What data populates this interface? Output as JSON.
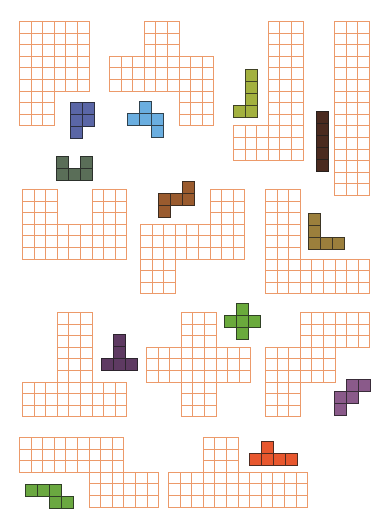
{
  "puzzle": {
    "grid_line_color": "#ec9a6a",
    "board_cell_size": 11.6,
    "piece_cell_size": 12,
    "boards": [
      {
        "id": "board-1",
        "x": 19,
        "y": 21,
        "rows": [
          "XXXXXX",
          "XXXXXX",
          "XXXXXX",
          "XXXXXX",
          "XXXXXX",
          "XXXXXX",
          "XXX...",
          "XXX...",
          "XXX..."
        ]
      },
      {
        "id": "board-2",
        "x": 109,
        "y": 21,
        "rows": [
          "...XXX...",
          "...XXX...",
          "...XXX...",
          "XXXXXXXXX",
          "XXXXXXXXX",
          "XXXXXXXXX",
          "......XXX",
          "......XXX",
          "......XXX"
        ]
      },
      {
        "id": "board-3",
        "x": 233,
        "y": 21,
        "rows": [
          "...XXX",
          "...XXX",
          "...XXX",
          "...XXX",
          "...XXX",
          "...XXX",
          "...XXX",
          "...XXX",
          "...XXX",
          "XXXXXX",
          "XXXXXX",
          "XXXXXX"
        ]
      },
      {
        "id": "board-4",
        "x": 334,
        "y": 21,
        "rows": [
          "XXX",
          "XXX",
          "XXX",
          "XXX",
          "XXX",
          "XXX",
          "XXX",
          "XXX",
          "XXX",
          "XXX",
          "XXX",
          "XXX",
          "XXX",
          "XXX",
          "XXX"
        ]
      },
      {
        "id": "board-5",
        "x": 22,
        "y": 189,
        "rows": [
          "XXX...XXX",
          "XXX...XXX",
          "XXX...XXX",
          "XXXXXXXXX",
          "XXXXXXXXX",
          "XXXXXXXXX"
        ]
      },
      {
        "id": "board-6",
        "x": 140,
        "y": 189,
        "rows": [
          "......XXX",
          "......XXX",
          "......XXX",
          "XXXXXXXXX",
          "XXXXXXXXX",
          "XXXXXXXXX",
          "XXX......",
          "XXX......",
          "XXX......"
        ]
      },
      {
        "id": "board-7",
        "x": 265,
        "y": 189,
        "rows": [
          "XXX......",
          "XXX......",
          "XXX......",
          "XXX......",
          "XXX......",
          "XXX......",
          "XXXXXXXXX",
          "XXXXXXXXX",
          "XXXXXXXXX"
        ]
      },
      {
        "id": "board-8",
        "x": 22,
        "y": 312,
        "rows": [
          "...XXX...",
          "...XXX...",
          "...XXX...",
          "...XXX...",
          "...XXX...",
          "...XXX...",
          "XXXXXXXXX",
          "XXXXXXXXX",
          "XXXXXXXXX"
        ]
      },
      {
        "id": "board-9",
        "x": 146,
        "y": 312,
        "rows": [
          "...XXX...",
          "...XXX...",
          "...XXX...",
          "XXXXXXXXX",
          "XXXXXXXXX",
          "XXXXXXXXX",
          "...XXX...",
          "...XXX...",
          "...XXX..."
        ]
      },
      {
        "id": "board-10",
        "x": 265,
        "y": 312,
        "rows": [
          "...XXXXXX",
          "...XXXXXX",
          "...XXXXXX",
          "XXXXXX...",
          "XXXXXX...",
          "XXXXXX...",
          "XXX......",
          "XXX......",
          "XXX......"
        ]
      },
      {
        "id": "board-11",
        "x": 19,
        "y": 437,
        "rows": [
          "XXXXXXXXX...",
          "XXXXXXXXX...",
          "XXXXXXXXX...",
          "......XXXXXX",
          "......XXXXXX",
          "......XXXXXX"
        ]
      },
      {
        "id": "board-12",
        "x": 168,
        "y": 437,
        "rows": [
          "...XXX......",
          "...XXX......",
          "...XXX......",
          "XXXXXXXXXXXX",
          "XXXXXXXXXXXX",
          "XXXXXXXXXXXX"
        ]
      }
    ],
    "pieces": [
      {
        "id": "piece-blue-p",
        "color": "#5a66a6",
        "x": 70,
        "y": 102,
        "rows": [
          "XX",
          "XX",
          "X."
        ]
      },
      {
        "id": "piece-lightblue-f",
        "color": "#6aaee0",
        "x": 127,
        "y": 101,
        "rows": [
          ".X.",
          "XXX",
          "..X"
        ]
      },
      {
        "id": "piece-gray-u",
        "color": "#5a6e58",
        "x": 56,
        "y": 156,
        "rows": [
          "X.X",
          "XXX"
        ]
      },
      {
        "id": "piece-olive-j",
        "color": "#a3b13f",
        "x": 233,
        "y": 69,
        "rows": [
          ".X",
          ".X",
          ".X",
          "XX"
        ]
      },
      {
        "id": "piece-darkbrown-i",
        "color": "#4a2a1f",
        "x": 316,
        "y": 111,
        "rows": [
          "X",
          "X",
          "X",
          "X",
          "X"
        ]
      },
      {
        "id": "piece-brown-s",
        "color": "#9a5b2e",
        "x": 158,
        "y": 181,
        "rows": [
          "..X",
          "XXX",
          "X.."
        ]
      },
      {
        "id": "piece-tan-l",
        "color": "#9b7f3c",
        "x": 308,
        "y": 213,
        "rows": [
          "X..",
          "X..",
          "XXX"
        ]
      },
      {
        "id": "piece-purple-t",
        "color": "#5e3a62",
        "x": 101,
        "y": 334,
        "rows": [
          ".X.",
          ".X.",
          "XXX"
        ]
      },
      {
        "id": "piece-green-plus",
        "color": "#6aaa3c",
        "x": 224,
        "y": 303,
        "rows": [
          ".X.",
          "XXX",
          ".X."
        ]
      },
      {
        "id": "piece-mauve-w",
        "color": "#8a5a8a",
        "x": 334,
        "y": 379,
        "rows": [
          ".XX",
          "XX.",
          "X.."
        ]
      },
      {
        "id": "piece-green-z",
        "color": "#6aa840",
        "x": 25,
        "y": 484,
        "rows": [
          "XXX.",
          "..XX"
        ]
      },
      {
        "id": "piece-red-y",
        "color": "#e8572e",
        "x": 249,
        "y": 441,
        "rows": [
          ".X..",
          "XXXX"
        ]
      }
    ]
  }
}
